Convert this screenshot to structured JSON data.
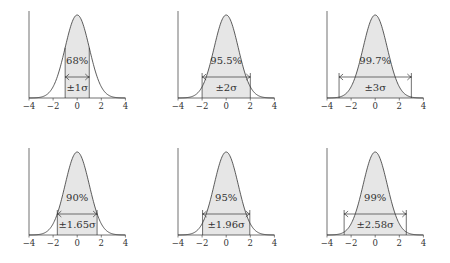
{
  "chart_data": [
    {
      "type": "area",
      "title": "",
      "xlabel": "",
      "ylabel": "",
      "xlim": [
        -4,
        4
      ],
      "x_ticks": [
        -4,
        -2,
        0,
        2,
        4
      ],
      "x_tick_labels": [
        "−4",
        "−2",
        "0",
        "2",
        "4"
      ],
      "curve": "standard normal pdf",
      "shaded_interval": [
        -1,
        1
      ],
      "percent_label": "68%",
      "interval_label": "±1σ",
      "grid": false
    },
    {
      "type": "area",
      "title": "",
      "xlabel": "",
      "ylabel": "",
      "xlim": [
        -4,
        4
      ],
      "x_ticks": [
        -4,
        -2,
        0,
        2,
        4
      ],
      "x_tick_labels": [
        "−4",
        "−2",
        "0",
        "2",
        "4"
      ],
      "curve": "standard normal pdf",
      "shaded_interval": [
        -2,
        2
      ],
      "percent_label": "95.5%",
      "interval_label": "±2σ",
      "grid": false
    },
    {
      "type": "area",
      "title": "",
      "xlabel": "",
      "ylabel": "",
      "xlim": [
        -4,
        4
      ],
      "x_ticks": [
        -4,
        -2,
        0,
        2,
        4
      ],
      "x_tick_labels": [
        "−4",
        "−2",
        "0",
        "2",
        "4"
      ],
      "curve": "standard normal pdf",
      "shaded_interval": [
        -3,
        3
      ],
      "percent_label": "99.7%",
      "interval_label": "±3σ",
      "grid": false
    },
    {
      "type": "area",
      "title": "",
      "xlabel": "",
      "ylabel": "",
      "xlim": [
        -4,
        4
      ],
      "x_ticks": [
        -4,
        -2,
        0,
        2,
        4
      ],
      "x_tick_labels": [
        "−4",
        "−2",
        "0",
        "2",
        "4"
      ],
      "curve": "standard normal pdf",
      "shaded_interval": [
        -1.65,
        1.65
      ],
      "percent_label": "90%",
      "interval_label": "±1.65σ",
      "grid": false
    },
    {
      "type": "area",
      "title": "",
      "xlabel": "",
      "ylabel": "",
      "xlim": [
        -4,
        4
      ],
      "x_ticks": [
        -4,
        -2,
        0,
        2,
        4
      ],
      "x_tick_labels": [
        "−4",
        "−2",
        "0",
        "2",
        "4"
      ],
      "curve": "standard normal pdf",
      "shaded_interval": [
        -1.96,
        1.96
      ],
      "percent_label": "95%",
      "interval_label": "±1.96σ",
      "grid": false
    },
    {
      "type": "area",
      "title": "",
      "xlabel": "",
      "ylabel": "",
      "xlim": [
        -4,
        4
      ],
      "x_ticks": [
        -4,
        -2,
        0,
        2,
        4
      ],
      "x_tick_labels": [
        "−4",
        "−2",
        "0",
        "2",
        "4"
      ],
      "curve": "standard normal pdf",
      "shaded_interval": [
        -2.58,
        2.58
      ],
      "percent_label": "99%",
      "interval_label": "±2.58σ",
      "grid": false
    }
  ],
  "style": {
    "fill_color": "#e6e6e6",
    "line_color": "#333333"
  }
}
